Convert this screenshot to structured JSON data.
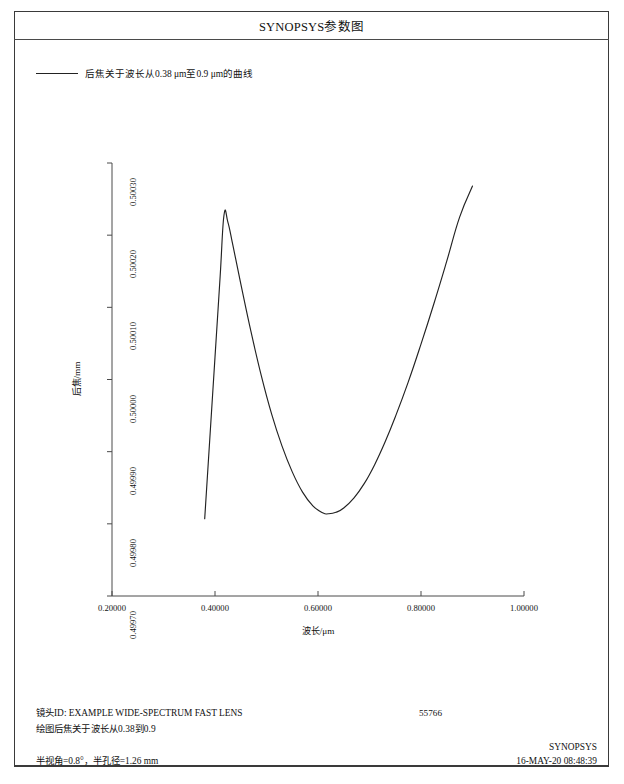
{
  "window": {
    "title": "SYNOPSYS参数图"
  },
  "legend": {
    "label": "后焦关于波长从0.38 μm至0.9 μm的曲线",
    "line_color": "#222222"
  },
  "footer": {
    "lens_id_line": "镜头ID: EXAMPLE WIDE-SPECTRUM FAST LENS",
    "plot_desc_line": "绘图后焦关于波长从0.38到0.9",
    "serial": "55766",
    "conditions": "半视角=0.8°，半孔径=1.26 mm",
    "brand": "SYNOPSYS",
    "timestamp": "16-MAY-20  08:48:39"
  },
  "chart_data": {
    "type": "line",
    "title": "SYNOPSYS参数图",
    "xlabel": "波长/μm",
    "ylabel": "后焦/mm",
    "xlim": [
      0.2,
      1.0
    ],
    "ylim": [
      0.4997,
      0.5003
    ],
    "grid": false,
    "legend_position": "top-left",
    "xticks": [
      "0.20000",
      "0.40000",
      "0.60000",
      "0.80000",
      "1.00000"
    ],
    "xtick_values": [
      0.2,
      0.4,
      0.6,
      0.8,
      1.0
    ],
    "yticks": [
      "0.49970",
      "0.49980",
      "0.49990",
      "0.50000",
      "0.50010",
      "0.50020",
      "0.50030"
    ],
    "ytick_values": [
      0.4997,
      0.4998,
      0.4999,
      0.5,
      0.5001,
      0.5002,
      0.5003
    ],
    "series": [
      {
        "name": "后焦关于波长从0.38 μm至0.9 μm的曲线",
        "color": "#222222",
        "x": [
          0.38,
          0.39,
          0.4,
          0.41,
          0.4175,
          0.425,
          0.435,
          0.45,
          0.47,
          0.49,
          0.51,
          0.53,
          0.55,
          0.57,
          0.59,
          0.61,
          0.62,
          0.635,
          0.65,
          0.67,
          0.69,
          0.71,
          0.73,
          0.75,
          0.775,
          0.8,
          0.825,
          0.85,
          0.875,
          0.9
        ],
        "y": [
          0.499807,
          0.499919,
          0.500031,
          0.500143,
          0.500228,
          0.500218,
          0.500185,
          0.500133,
          0.500066,
          0.500005,
          0.499952,
          0.499908,
          0.499872,
          0.499844,
          0.499825,
          0.499815,
          0.499814,
          0.499816,
          0.499822,
          0.499836,
          0.499856,
          0.499882,
          0.499913,
          0.499948,
          0.499996,
          0.500049,
          0.500105,
          0.500164,
          0.500225,
          0.500268
        ]
      }
    ]
  },
  "plot_geometry": {
    "x_left_px": 112,
    "x_right_px": 524,
    "y_top_px": 163,
    "y_bottom_px": 596
  }
}
